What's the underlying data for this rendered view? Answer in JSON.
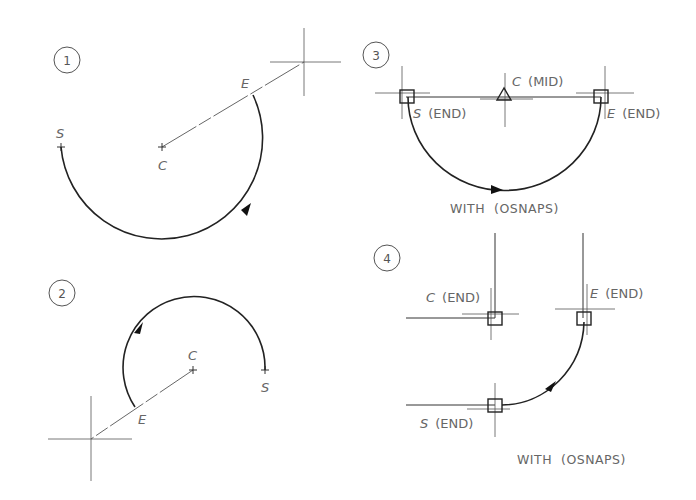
{
  "figure": {
    "panels": [
      {
        "number": "1",
        "labels": {
          "start": "S",
          "center": "C",
          "end": "E"
        },
        "direction": "counterclockwise"
      },
      {
        "number": "2",
        "labels": {
          "start": "S",
          "center": "C",
          "end": "E"
        },
        "direction": "counterclockwise"
      },
      {
        "number": "3",
        "labels": {
          "start_letter": "S",
          "start_suffix": "(END)",
          "center_letter": "C",
          "center_suffix": "(MID)",
          "end_letter": "E",
          "end_suffix": "(END)"
        },
        "caption": "WITH  (OSNAPS)",
        "direction": "counterclockwise"
      },
      {
        "number": "4",
        "labels": {
          "center_letter": "C",
          "center_suffix": "(END)",
          "end_letter": "E",
          "end_suffix": "(END)",
          "start_letter": "S",
          "start_suffix": "(END)"
        },
        "caption": "WITH  (OSNAPS)",
        "direction": "counterclockwise"
      }
    ]
  }
}
